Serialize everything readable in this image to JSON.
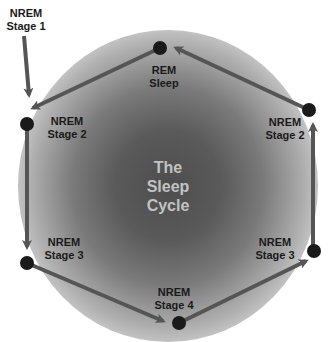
{
  "title": {
    "line1": "The",
    "line2": "Sleep",
    "line3": "Cycle"
  },
  "nodes": [
    {
      "id": "nrem-stage-1",
      "line1": "NREM",
      "line2": "Stage 1"
    },
    {
      "id": "nrem-stage-2-left",
      "line1": "NREM",
      "line2": "Stage 2"
    },
    {
      "id": "nrem-stage-3-left",
      "line1": "NREM",
      "line2": "Stage 3"
    },
    {
      "id": "nrem-stage-4",
      "line1": "NREM",
      "line2": "Stage 4"
    },
    {
      "id": "nrem-stage-3-right",
      "line1": "NREM",
      "line2": "Stage 3"
    },
    {
      "id": "nrem-stage-2-right",
      "line1": "NREM",
      "line2": "Stage 2"
    },
    {
      "id": "rem-sleep",
      "line1": "REM",
      "line2": "Sleep"
    }
  ],
  "flow": [
    "NREM Stage 1 -> NREM Stage 2",
    "NREM Stage 2 -> NREM Stage 3",
    "NREM Stage 3 -> NREM Stage 4",
    "NREM Stage 4 -> NREM Stage 3",
    "NREM Stage 3 -> NREM Stage 2",
    "NREM Stage 2 -> REM Sleep",
    "REM Sleep -> NREM Stage 2"
  ],
  "colors": {
    "line": "#555555",
    "node": "#1a1a1a",
    "center_dark": "#4d4d4d",
    "center_text": "#c2c2c2"
  }
}
